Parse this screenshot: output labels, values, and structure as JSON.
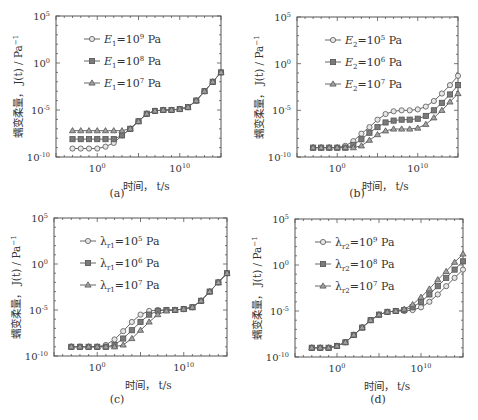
{
  "figure": {
    "x_tick_labels": [
      "10^0",
      "10^10"
    ],
    "y_tick_labels": [
      "10^-10",
      "10^-5",
      "10^0",
      "10^5"
    ],
    "xlabel": "时间， t/s",
    "ylabel": "蠕变柔量， J(t)/Pa^-1"
  },
  "chart_data": [
    {
      "panel": "(a)",
      "type": "line",
      "xscale": "log",
      "yscale": "log",
      "xlabel": "时间, t/s",
      "ylabel": "蠕变柔量, J(t)/Pa^-1",
      "xlim_log10": [
        -5,
        15
      ],
      "ylim_log10": [
        -10,
        5
      ],
      "x_log10": [
        -3,
        -2,
        -1,
        0,
        1,
        2,
        3,
        4,
        5,
        6,
        7,
        8,
        9,
        10,
        11,
        12,
        13,
        14,
        15
      ],
      "series": [
        {
          "name": "E1=10^9 Pa",
          "marker": "circle",
          "values_log10": [
            -9.1,
            -9.1,
            -9.1,
            -9.1,
            -8.9,
            -8.5,
            -7.7,
            -7.0,
            -6.2,
            -5.4,
            -5.1,
            -5.0,
            -5.0,
            -4.9,
            -4.7,
            -4.0,
            -3.0,
            -2.0,
            -1.0,
            0.1
          ]
        },
        {
          "name": "E1=10^8 Pa",
          "marker": "square",
          "values_log10": [
            -8.1,
            -8.1,
            -8.1,
            -8.1,
            -8.1,
            -8.1,
            -7.7,
            -7.0,
            -6.2,
            -5.4,
            -5.1,
            -5.0,
            -5.0,
            -4.9,
            -4.7,
            -4.0,
            -3.0,
            -2.0,
            -1.0,
            0.1
          ]
        },
        {
          "name": "E1=10^7 Pa",
          "marker": "triangle",
          "values_log10": [
            -7.2,
            -7.2,
            -7.2,
            -7.2,
            -7.2,
            -7.2,
            -7.2,
            -7.0,
            -6.2,
            -5.4,
            -5.1,
            -5.0,
            -5.0,
            -4.9,
            -4.7,
            -4.0,
            -3.0,
            -2.0,
            -1.0,
            0.1
          ]
        }
      ]
    },
    {
      "panel": "(b)",
      "type": "line",
      "xscale": "log",
      "yscale": "log",
      "xlabel": "时间, t/s",
      "ylabel": "蠕变柔量, J(t)/Pa^-1",
      "xlim_log10": [
        -5,
        15
      ],
      "ylim_log10": [
        -10,
        5
      ],
      "x_log10": [
        -3,
        -2,
        -1,
        0,
        1,
        2,
        3,
        4,
        5,
        6,
        7,
        8,
        9,
        10,
        11,
        12,
        13,
        14,
        15
      ],
      "series": [
        {
          "name": "E2=10^5 Pa",
          "marker": "circle",
          "values_log10": [
            -9.0,
            -9.0,
            -9.0,
            -9.0,
            -8.8,
            -8.3,
            -7.5,
            -6.8,
            -6.0,
            -5.4,
            -5.1,
            -5.0,
            -5.0,
            -4.9,
            -4.6,
            -4.0,
            -3.2,
            -2.3,
            -1.3,
            -0.4,
            0.4
          ]
        },
        {
          "name": "E2=10^6 Pa",
          "marker": "square",
          "values_log10": [
            -9.0,
            -9.0,
            -9.0,
            -9.0,
            -9.0,
            -8.7,
            -8.1,
            -7.4,
            -6.8,
            -6.3,
            -6.1,
            -6.0,
            -6.0,
            -5.9,
            -5.6,
            -5.0,
            -4.2,
            -3.3,
            -2.3,
            -1.4,
            -0.6
          ]
        },
        {
          "name": "E2=10^7 Pa",
          "marker": "triangle",
          "values_log10": [
            -9.0,
            -9.0,
            -9.0,
            -9.0,
            -9.0,
            -9.0,
            -8.8,
            -8.2,
            -7.6,
            -7.2,
            -7.0,
            -7.0,
            -7.0,
            -6.9,
            -6.5,
            -5.8,
            -5.0,
            -4.1,
            -3.2,
            -2.3,
            -1.4
          ]
        }
      ]
    },
    {
      "panel": "(c)",
      "type": "line",
      "xscale": "log",
      "yscale": "log",
      "xlabel": "时间, t/s",
      "ylabel": "蠕变柔量, J(t)/Pa^-1",
      "xlim_log10": [
        -5,
        15
      ],
      "ylim_log10": [
        -10,
        5
      ],
      "x_log10": [
        -3,
        -2,
        -1,
        0,
        1,
        2,
        3,
        4,
        5,
        6,
        7,
        8,
        9,
        10,
        11,
        12,
        13,
        14,
        15
      ],
      "series": [
        {
          "name": "λr1=10^5 Pa",
          "marker": "circle",
          "values_log10": [
            -9.0,
            -9.0,
            -9.0,
            -9.0,
            -8.8,
            -8.2,
            -7.3,
            -6.3,
            -5.5,
            -5.1,
            -5.0,
            -5.0,
            -5.0,
            -4.9,
            -4.7,
            -4.0,
            -3.0,
            -2.0,
            -1.0,
            0.1
          ]
        },
        {
          "name": "λr1=10^6 Pa",
          "marker": "square",
          "values_log10": [
            -9.0,
            -9.0,
            -9.0,
            -9.0,
            -9.0,
            -8.8,
            -8.1,
            -7.2,
            -6.3,
            -5.5,
            -5.1,
            -5.0,
            -5.0,
            -4.9,
            -4.7,
            -4.0,
            -3.0,
            -2.0,
            -1.0,
            0.1
          ]
        },
        {
          "name": "λr1=10^7 Pa",
          "marker": "triangle",
          "values_log10": [
            -9.0,
            -9.0,
            -9.0,
            -9.0,
            -9.0,
            -9.0,
            -8.8,
            -8.1,
            -7.2,
            -6.3,
            -5.5,
            -5.1,
            -5.0,
            -4.9,
            -4.7,
            -4.0,
            -3.0,
            -2.0,
            -1.0,
            0.1
          ]
        }
      ]
    },
    {
      "panel": "(d)",
      "type": "line",
      "xscale": "log",
      "yscale": "log",
      "xlabel": "时间, t/s",
      "ylabel": "蠕变柔量, J(t)/Pa^-1",
      "xlim_log10": [
        -5,
        15
      ],
      "ylim_log10": [
        -10,
        5
      ],
      "x_log10": [
        -3,
        -2,
        -1,
        0,
        1,
        2,
        3,
        4,
        5,
        6,
        7,
        8,
        9,
        10,
        11,
        12,
        13,
        14,
        15
      ],
      "series": [
        {
          "name": "λr2=10^9 Pa",
          "marker": "circle",
          "values_log10": [
            -9.0,
            -9.0,
            -9.0,
            -8.8,
            -8.4,
            -7.6,
            -6.8,
            -6.0,
            -5.4,
            -5.1,
            -5.0,
            -5.0,
            -4.9,
            -4.6,
            -4.0,
            -3.2,
            -2.3,
            -1.4,
            -0.5,
            0.3
          ]
        },
        {
          "name": "λr2=10^8 Pa",
          "marker": "square",
          "values_log10": [
            -9.0,
            -9.0,
            -9.0,
            -8.8,
            -8.4,
            -7.6,
            -6.8,
            -6.0,
            -5.4,
            -5.1,
            -5.0,
            -4.9,
            -4.6,
            -4.0,
            -3.2,
            -2.3,
            -1.4,
            -0.5,
            0.4,
            1.3
          ]
        },
        {
          "name": "λr2=10^7 Pa",
          "marker": "triangle",
          "values_log10": [
            -9.0,
            -9.0,
            -9.0,
            -8.8,
            -8.4,
            -7.6,
            -6.8,
            -6.0,
            -5.4,
            -5.1,
            -5.0,
            -4.8,
            -4.3,
            -3.5,
            -2.6,
            -1.6,
            -0.7,
            0.3,
            1.2,
            2.2
          ]
        }
      ]
    }
  ],
  "panels": [
    {
      "caption": "(a)",
      "legend": [
        {
          "sym": "E",
          "sub": "1",
          "exp": "9"
        },
        {
          "sym": "E",
          "sub": "1",
          "exp": "8"
        },
        {
          "sym": "E",
          "sub": "1",
          "exp": "7"
        }
      ]
    },
    {
      "caption": "(b)",
      "legend": [
        {
          "sym": "E",
          "sub": "2",
          "exp": "5"
        },
        {
          "sym": "E",
          "sub": "2",
          "exp": "6"
        },
        {
          "sym": "E",
          "sub": "2",
          "exp": "7"
        }
      ]
    },
    {
      "caption": "(c)",
      "legend": [
        {
          "sym": "λ",
          "sub": "r1",
          "exp": "5"
        },
        {
          "sym": "λ",
          "sub": "r1",
          "exp": "6"
        },
        {
          "sym": "λ",
          "sub": "r1",
          "exp": "7"
        }
      ]
    },
    {
      "caption": "(d)",
      "legend": [
        {
          "sym": "λ",
          "sub": "r2",
          "exp": "9"
        },
        {
          "sym": "λ",
          "sub": "r2",
          "exp": "8"
        },
        {
          "sym": "λ",
          "sub": "r2",
          "exp": "7"
        }
      ]
    }
  ],
  "colors": {
    "axis": "#555555",
    "line": "#666666",
    "circle_fill": "#e6e6e6",
    "square_fill": "#7a7a7a",
    "triangle_fill": "#a0a0a0",
    "marker_stroke": "#555555"
  },
  "units": "Pa"
}
